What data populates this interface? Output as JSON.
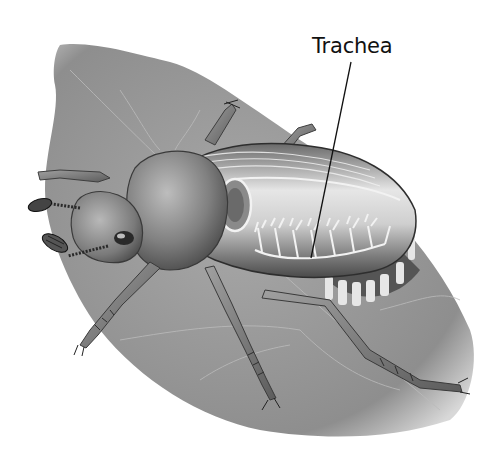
{
  "diagram": {
    "labels": [
      {
        "id": "trachea",
        "text": "Trachea",
        "x": 312,
        "y": 34,
        "pointer_to": [
          311,
          258
        ]
      }
    ],
    "colors": {
      "background": "#ffffff",
      "leaf": "#9a9a9a",
      "body": "#7a7a7a",
      "highlight": "#e8e8e8",
      "trachea": "#f2f2f2",
      "label_text": "#111111",
      "leader_line": "#111111"
    }
  }
}
